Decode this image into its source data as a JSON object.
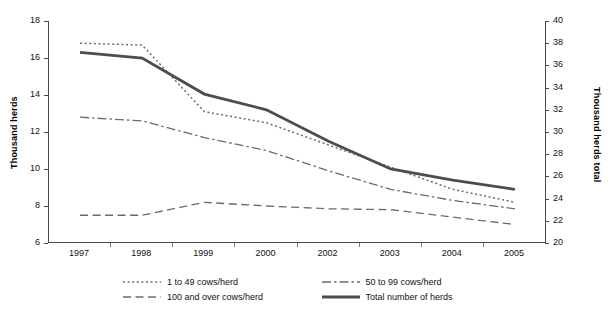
{
  "chart_data": {
    "type": "line",
    "title": "",
    "xlabel": "",
    "ylabel": "Thousand herds",
    "ylabel_right": "Thousand herds total",
    "categories": [
      "1997",
      "1998",
      "1999",
      "2000",
      "2002",
      "2003",
      "2004",
      "2005"
    ],
    "ylim": [
      6,
      18
    ],
    "yticks": [
      6,
      8,
      10,
      12,
      14,
      16,
      18
    ],
    "ylim_right": [
      20,
      40
    ],
    "yticks_right": [
      20,
      22,
      24,
      26,
      28,
      30,
      32,
      34,
      36,
      38,
      40
    ],
    "grid": false,
    "legend_position": "bottom",
    "series": [
      {
        "name": "1 to 49 cows/herd",
        "style": "dotted",
        "axis": "left",
        "color": "#6b6b6b",
        "values": [
          16.8,
          16.7,
          13.1,
          12.5,
          11.3,
          10.1,
          8.9,
          8.2
        ]
      },
      {
        "name": "50 to 99 cows/herd",
        "style": "dash-dot",
        "axis": "left",
        "color": "#6b6b6b",
        "values": [
          12.8,
          12.6,
          11.7,
          11.0,
          9.9,
          8.9,
          8.3,
          7.85
        ]
      },
      {
        "name": "100 and over cows/herd",
        "style": "dashed",
        "axis": "left",
        "color": "#6b6b6b",
        "values": [
          7.5,
          7.5,
          8.2,
          8.0,
          7.85,
          7.8,
          7.4,
          7.0
        ]
      },
      {
        "name": "Total number of herds",
        "style": "solid",
        "axis": "right",
        "color": "#4d4d4d",
        "values_right": [
          37.2,
          36.7,
          30.4,
          28.6,
          26.6,
          25.9,
          25.3,
          24.7
        ],
        "values": [
          16.3,
          16.0,
          14.05,
          13.2,
          11.5,
          10.0,
          9.4,
          8.9
        ]
      }
    ]
  }
}
